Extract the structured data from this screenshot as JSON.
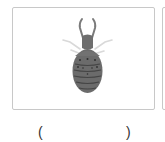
{
  "question": {
    "image": {
      "subject": "antlion-larva",
      "colors": {
        "body": "#6b6b6b",
        "body_dark": "#3e3e3e",
        "legs": "#d6d6d6",
        "frame_border": "#c8c8c8"
      }
    },
    "answer": {
      "open_paren": "(",
      "close_paren": ")",
      "value": ""
    }
  }
}
